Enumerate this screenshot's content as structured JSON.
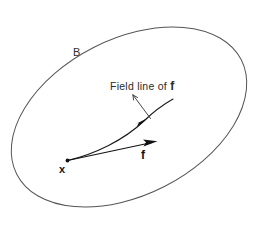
{
  "figure": {
    "background_color": "#ffffff",
    "width": 257,
    "height": 231,
    "labels": {
      "region": "B",
      "point": "x",
      "vector": "f",
      "annotation_prefix": "Field line of ",
      "annotation_symbol": "f",
      "annotation_full": "Field line of f"
    },
    "colors": {
      "boundary_stroke": "#555555",
      "field_line_stroke": "#1a1a1a",
      "vector_stroke": "#111111",
      "leader_stroke": "#333333",
      "text": "#1a1a1a"
    },
    "geometry": {
      "region_boundary": {
        "shape": "ellipse",
        "center_x": 129,
        "center_y": 117,
        "radius_x": 126,
        "radius_y": 78,
        "rotation_deg": -27
      },
      "base_point": {
        "x": 68,
        "y": 160
      },
      "vector_tip": {
        "x": 154,
        "y": 142
      },
      "field_line_end": {
        "x": 173,
        "y": 99
      },
      "field_line_arrow": {
        "x": 144,
        "y": 122
      },
      "leader_start": {
        "x": 133,
        "y": 95
      },
      "leader_end": {
        "x": 150,
        "y": 118
      }
    }
  }
}
